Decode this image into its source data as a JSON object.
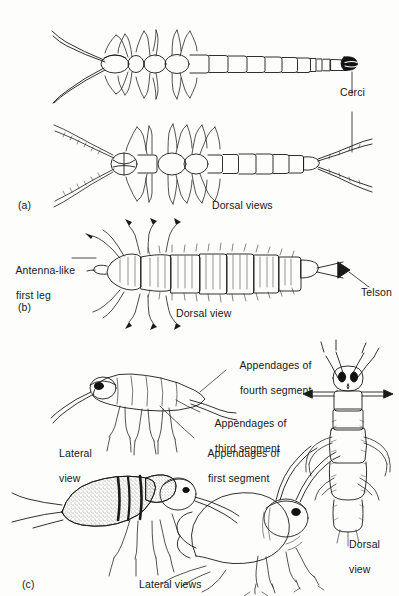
{
  "figure": {
    "type": "scientific-line-illustration",
    "background_color": "#fdfdfb",
    "ink_color": "#1a1a1a",
    "panels": [
      {
        "id": "a",
        "id_label": "(a)",
        "caption": "Dorsal views",
        "annotations": [
          {
            "name": "cerci",
            "text": "Cerci",
            "leader": "vertical"
          }
        ],
        "specimens": [
          {
            "name": "elongate-segmented-insect-upper",
            "view": "dorsal",
            "features": "long antennae, three leg pairs, 11 abdominal segments, dark forceps-like cerci"
          },
          {
            "name": "elongate-segmented-insect-lower",
            "view": "dorsal",
            "features": "beaded antennae, three leg pairs, segmented abdomen, long filamentous cerci"
          }
        ]
      },
      {
        "id": "b",
        "id_label": "(b)",
        "caption": "Dorsal view",
        "annotations": [
          {
            "name": "antenna-like-first-leg",
            "text_line_1": "Antenna-like",
            "text_line_2": "first leg",
            "leader": "horizontal"
          },
          {
            "name": "telson",
            "text": "Telson",
            "leader": "diagonal"
          }
        ],
        "specimens": [
          {
            "name": "setose-segmented-larva",
            "view": "dorsal",
            "features": "broad bristled body, antenna-like first legs, pointed telson"
          }
        ]
      },
      {
        "id": "c",
        "id_label": "(c)",
        "caption": "Lateral views",
        "annotations": [
          {
            "name": "appendages-fourth-segment",
            "text_line_1": "Appendages of",
            "text_line_2": "fourth segment"
          },
          {
            "name": "appendages-third-segment",
            "text_line_1": "Appendages of",
            "text_line_2": "third segment"
          },
          {
            "name": "appendages-first-segment",
            "text_line_1": "Appendages of",
            "text_line_2": "first segment"
          },
          {
            "name": "lateral-view-left",
            "text_line_1": "Lateral",
            "text_line_2": "view"
          },
          {
            "name": "dorsal-view-right",
            "text_line_1": "Dorsal",
            "text_line_2": "view"
          }
        ],
        "specimens": [
          {
            "name": "lateral-nymph-top",
            "view": "lateral",
            "features": "slender elongate body, dark eye, segmented legs, long cerci"
          },
          {
            "name": "dorsal-nymph-right",
            "view": "dorsal",
            "features": "two antennae, paired dark eye spots, lateral spine-like appendages"
          },
          {
            "name": "stippled-lateral-nymph",
            "view": "lateral",
            "features": "stippled swollen abdomen, dark banded thorax, long trailing legs"
          },
          {
            "name": "humpbacked-lateral-nymph",
            "view": "lateral",
            "features": "hunched rounded body, long curved antennae, dark eye"
          }
        ]
      }
    ]
  }
}
